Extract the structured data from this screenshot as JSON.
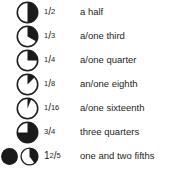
{
  "colors": {
    "background": "#ffffff",
    "ink": "#231f20",
    "fill": "#1a1a1a",
    "stroke": "#231f20"
  },
  "rows": [
    {
      "icon_name": "pie-one-half-icon",
      "fraction_value": 0.5,
      "whole": "",
      "numerator": "1",
      "slash": "/",
      "denominator": "2",
      "label": "a half"
    },
    {
      "icon_name": "pie-one-third-icon",
      "fraction_value": 0.3333,
      "whole": "",
      "numerator": "1",
      "slash": "/",
      "denominator": "3",
      "label": "a/one third"
    },
    {
      "icon_name": "pie-one-quarter-icon",
      "fraction_value": 0.25,
      "whole": "",
      "numerator": "1",
      "slash": "/",
      "denominator": "4",
      "label": "a/one quarter"
    },
    {
      "icon_name": "pie-one-eighth-icon",
      "fraction_value": 0.125,
      "whole": "",
      "numerator": "1",
      "slash": "/",
      "denominator": "8",
      "label": "an/one eighth"
    },
    {
      "icon_name": "pie-one-sixteenth-icon",
      "fraction_value": 0.0625,
      "whole": "",
      "numerator": "1",
      "slash": "/",
      "denominator": "16",
      "label": "a/one sixteenth"
    },
    {
      "icon_name": "pie-three-quarters-icon",
      "fraction_value": 0.75,
      "whole": "",
      "numerator": "3",
      "slash": "/",
      "denominator": "4",
      "label": "three quarters"
    },
    {
      "icon_name": "pie-two-fifths-icon",
      "fraction_value": 0.4,
      "whole": "1",
      "numerator": "2",
      "slash": "/",
      "denominator": "5",
      "label": "one and two fifths",
      "has_whole_circle": true,
      "whole_circle_icon_name": "circle-whole-filled-icon"
    }
  ]
}
